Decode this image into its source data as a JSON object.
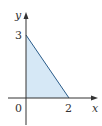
{
  "diagram": {
    "type": "region-plot",
    "axes": {
      "x_label": "x",
      "y_label": "y",
      "origin_label": "0"
    },
    "ticks": {
      "x_intercept_label": "2",
      "y_intercept_label": "3"
    },
    "region": {
      "shape": "triangle",
      "vertices": [
        [
          0,
          0
        ],
        [
          0,
          3
        ],
        [
          2,
          0
        ]
      ],
      "fill_color": "#d6e8f6",
      "edge_color": "#2a5c8a"
    },
    "colors": {
      "axis": "#333333"
    }
  }
}
